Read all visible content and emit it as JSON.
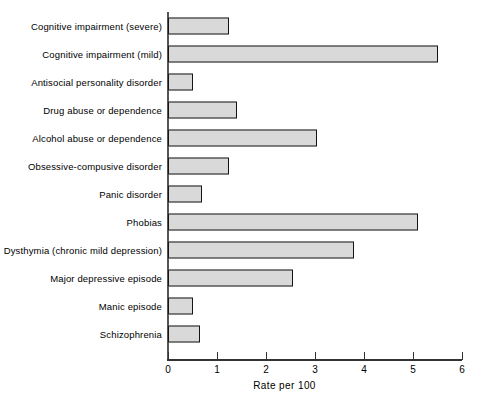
{
  "chart_data": {
    "type": "bar",
    "orientation": "horizontal",
    "title": "",
    "xlabel": "Rate per 100",
    "ylabel": "",
    "xlim": [
      0,
      6
    ],
    "xticks": [
      0,
      1,
      2,
      3,
      4,
      5,
      6
    ],
    "xtick_labels": [
      "0",
      "1",
      "2",
      "3",
      "4",
      "5",
      "6"
    ],
    "grid": false,
    "legend": null,
    "bar_fill_color": "#d9d9d9",
    "bar_edge_color": "#141414",
    "axis_color": "#333333",
    "background_color": "#ffffff",
    "categories": [
      "Cognitive impairment (severe)",
      "Cognitive impairment (mild)",
      "Antisocial personality disorder",
      "Drug abuse or dependence",
      "Alcohol abuse or dependence",
      "Obsessive-compusive disorder",
      "Panic disorder",
      "Phobias",
      "Dysthymia (chronic mild depression)",
      "Major depressive episode",
      "Manic episode",
      "Schizophrenia"
    ],
    "values": [
      1.25,
      5.5,
      0.5,
      1.4,
      3.05,
      1.25,
      0.7,
      5.1,
      3.8,
      2.55,
      0.5,
      0.65
    ]
  }
}
